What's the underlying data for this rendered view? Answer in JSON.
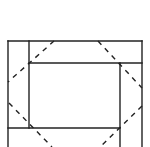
{
  "diagram": {
    "colors": {
      "background": "#ffffff",
      "line": "#222222"
    },
    "solid_lines": [
      {
        "id": "outer-top",
        "x1": 8,
        "y1": 41,
        "x2": 142,
        "y2": 41
      },
      {
        "id": "outer-left",
        "x1": 8,
        "y1": 41,
        "x2": 8,
        "y2": 147
      },
      {
        "id": "outer-right",
        "x1": 142,
        "y1": 41,
        "x2": 142,
        "y2": 147
      },
      {
        "id": "inner-left-vertical",
        "x1": 29,
        "y1": 41,
        "x2": 29,
        "y2": 128
      },
      {
        "id": "inner-top-horizontal",
        "x1": 29,
        "y1": 63,
        "x2": 142,
        "y2": 63
      },
      {
        "id": "inner-right-vertical",
        "x1": 120,
        "y1": 63,
        "x2": 120,
        "y2": 147
      },
      {
        "id": "inner-bottom-horizontal",
        "x1": 8,
        "y1": 128,
        "x2": 120,
        "y2": 128
      }
    ],
    "dashed_lines": [
      {
        "id": "dash-top-left",
        "x1": 54,
        "y1": 41,
        "x2": 8,
        "y2": 82
      },
      {
        "id": "dash-top-right",
        "x1": 98,
        "y1": 41,
        "x2": 142,
        "y2": 88
      },
      {
        "id": "dash-bottom-left",
        "x1": 9,
        "y1": 103,
        "x2": 52,
        "y2": 147
      },
      {
        "id": "dash-bottom-right",
        "x1": 142,
        "y1": 106,
        "x2": 100,
        "y2": 147
      }
    ]
  }
}
